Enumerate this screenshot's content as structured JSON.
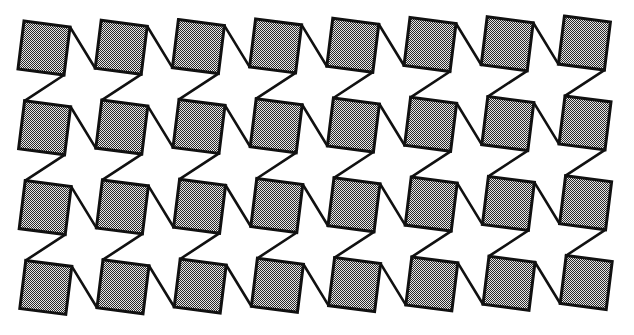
{
  "figure": {
    "columns": 8,
    "rows": 4,
    "origin": {
      "x": 24,
      "y": 21
    },
    "column_step": {
      "dx": 77.2,
      "dy": -0.7
    },
    "row_step": {
      "dx": 0.6,
      "dy": 79.8
    },
    "square_offsets": {
      "top_left": [
        0,
        0
      ],
      "top_right": [
        46,
        6
      ],
      "bottom_right": [
        40,
        54
      ],
      "bottom_left": [
        -6,
        48
      ]
    },
    "colors": {
      "background": "#ffffff",
      "stroke": "#111111",
      "dither_dark": "#2a2a2a",
      "dither_light": "#e6e6e6"
    }
  }
}
